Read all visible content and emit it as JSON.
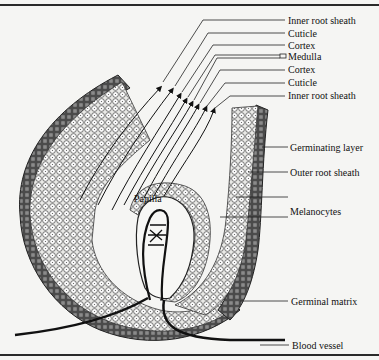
{
  "figure": {
    "colors": {
      "background": "#f5f5f3",
      "ink": "#111111",
      "outer_cells": "#6e6e6e",
      "inner_cells": "#f0f0f0"
    },
    "labels": [
      {
        "id": "inner-root-sheath-1",
        "text": "Inner root sheath",
        "x": 287,
        "y": 15
      },
      {
        "id": "cuticle-1",
        "text": "Cuticle",
        "x": 287,
        "y": 27
      },
      {
        "id": "cortex-1",
        "text": "Cortex",
        "x": 287,
        "y": 39
      },
      {
        "id": "medulla",
        "text": "Medulla",
        "x": 287,
        "y": 51
      },
      {
        "id": "cortex-2",
        "text": "Cortex",
        "x": 287,
        "y": 63
      },
      {
        "id": "cuticle-2",
        "text": "Cuticle",
        "x": 287,
        "y": 75
      },
      {
        "id": "inner-root-sheath-2",
        "text": "Inner root sheath",
        "x": 287,
        "y": 88
      },
      {
        "id": "germinating-layer",
        "text": "Germinating layer",
        "x": 290,
        "y": 140
      },
      {
        "id": "outer-root-sheath",
        "text": "Outer root sheath",
        "x": 290,
        "y": 165
      },
      {
        "id": "melanocytes",
        "text": "Melanocytes",
        "x": 290,
        "y": 210
      },
      {
        "id": "papilla",
        "text": "Papilla",
        "x": 134,
        "y": 196
      },
      {
        "id": "germinal-matrix",
        "text": "Germinal matrix",
        "x": 290,
        "y": 294
      },
      {
        "id": "blood-vessel",
        "text": "Blood vessel",
        "x": 291,
        "y": 340
      }
    ]
  }
}
